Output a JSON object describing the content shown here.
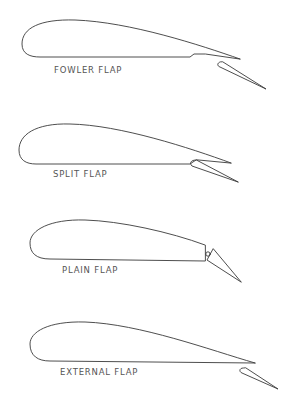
{
  "diagram": {
    "type": "airfoil-flap-types",
    "stroke_color": "#3a3a3a",
    "label_color": "#555555",
    "figures": [
      {
        "id": "fowler",
        "label": "FOWLER FLAP"
      },
      {
        "id": "split",
        "label": "SPLIT FLAP"
      },
      {
        "id": "plain",
        "label": "PLAIN FLAP"
      },
      {
        "id": "external",
        "label": "EXTERNAL FLAP"
      }
    ]
  }
}
